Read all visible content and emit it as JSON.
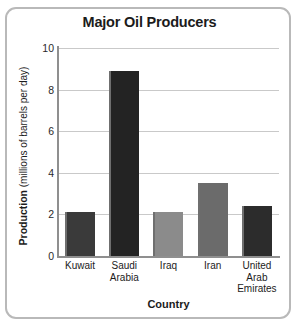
{
  "chart_data": {
    "type": "bar",
    "title": "Major Oil Producers",
    "xlabel": "Country",
    "ylabel_bold": "Production",
    "ylabel_rest": " (millions of barrels per day)",
    "ylabel_full": "Production (millions of barrels per day)",
    "categories": [
      "Kuwait",
      "Saudi Arabia",
      "Iraq",
      "Iran",
      "United Arab Emirates"
    ],
    "category_lines": [
      [
        "Kuwait"
      ],
      [
        "Saudi",
        "Arabia"
      ],
      [
        "Iraq"
      ],
      [
        "Iran"
      ],
      [
        "United",
        "Arab",
        "Emirates"
      ]
    ],
    "values": [
      2.1,
      8.9,
      2.1,
      3.5,
      2.4
    ],
    "bar_colors": [
      "#3a3a3a",
      "#232323",
      "#8b8b8b",
      "#6b6b6b",
      "#2c2c2c"
    ],
    "ylim": [
      0,
      10
    ],
    "yticks": [
      0,
      2,
      4,
      6,
      8,
      10
    ],
    "grid": true,
    "legend": "none"
  },
  "frame": {
    "border_color": "#b9b9b9",
    "axis_color": "#8f8f8f",
    "grid_color": "#c9c9c9"
  }
}
